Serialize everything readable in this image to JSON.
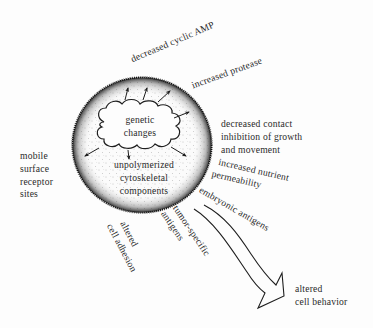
{
  "diagram": {
    "type": "cell-transformation-schematic",
    "cell": {
      "label_cloud": [
        "genetic",
        "changes"
      ],
      "label_interior": [
        "unpolymerized",
        "cytoskeletal",
        "components"
      ]
    },
    "effects": {
      "decreased_cyclic_amp": "decreased cyclic AMP",
      "increased_protease": "increased protease",
      "decreased_contact": [
        "decreased contact",
        "inhibition of growth",
        "and movement"
      ],
      "increased_nutrient": [
        "increased nutrient",
        "permeability"
      ],
      "embryonic_antigens": "embryonic antigens",
      "tumor_specific": [
        "tumor-specific",
        "antigens"
      ],
      "altered_adhesion": [
        "altered",
        "cell adhesion"
      ],
      "mobile_receptors": [
        "mobile",
        "surface",
        "receptor",
        "sites"
      ]
    },
    "outcome": [
      "altered",
      "cell behavior"
    ],
    "colors": {
      "ink": "#1e1e1e",
      "background": "#fdfdfd"
    }
  }
}
